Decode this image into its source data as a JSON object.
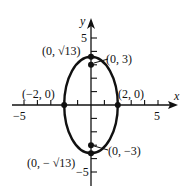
{
  "figure": {
    "type": "ellipse graph",
    "axes": {
      "x_label": "x",
      "y_label": "y",
      "x_tick_labels": [
        "-5",
        "5"
      ],
      "y_tick_labels": [
        "5",
        "-5"
      ],
      "x_range": [
        -5,
        5
      ],
      "y_range": [
        -5,
        5
      ]
    },
    "ellipse": {
      "center": [
        0,
        0
      ],
      "semi_major_axis_vertical": "√13",
      "semi_minor_axis_horizontal": 2
    },
    "points": [
      {
        "label": "(0, √13)",
        "x": 0,
        "y": 3.606,
        "role": "vertex"
      },
      {
        "label": "(0, 3)",
        "x": 0,
        "y": 3,
        "role": "focus"
      },
      {
        "label": "(−2, 0)",
        "x": -2,
        "y": 0,
        "role": "co-vertex"
      },
      {
        "label": "(2, 0)",
        "x": 2,
        "y": 0,
        "role": "co-vertex"
      },
      {
        "label": "(0, −3)",
        "x": 0,
        "y": -3,
        "role": "focus"
      },
      {
        "label": "(0, − √13)",
        "x": 0,
        "y": -3.606,
        "role": "vertex"
      }
    ]
  },
  "text": {
    "x_axis": "x",
    "y_axis": "y",
    "x_neg5": "−5",
    "x_pos5": "5",
    "y_pos5": "5",
    "y_neg5": "−5",
    "pt_top_vertex": "(0, √13)",
    "pt_top_focus": "(0, 3)",
    "pt_left": "(−2, 0)",
    "pt_right": "(2, 0)",
    "pt_bottom_focus": "(0, −3)",
    "pt_bottom_vertex": "(0, − √13)"
  },
  "colors": {
    "ink": "#111111",
    "background": "#ffffff"
  }
}
